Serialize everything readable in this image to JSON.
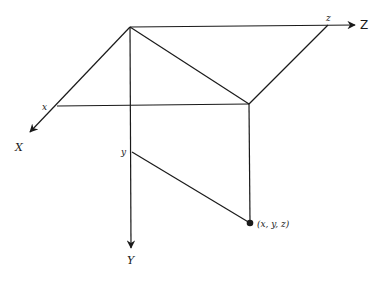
{
  "diagram": {
    "axes": {
      "x_axis_label": "X",
      "y_axis_label": "Y",
      "z_axis_label": "Z"
    },
    "ticks": {
      "x_label": "x",
      "y_label": "y",
      "z_label": "z"
    },
    "point": {
      "label": "(x, y, z)"
    },
    "colors": {
      "line": "#1a1a1a",
      "background": "#ffffff"
    }
  }
}
